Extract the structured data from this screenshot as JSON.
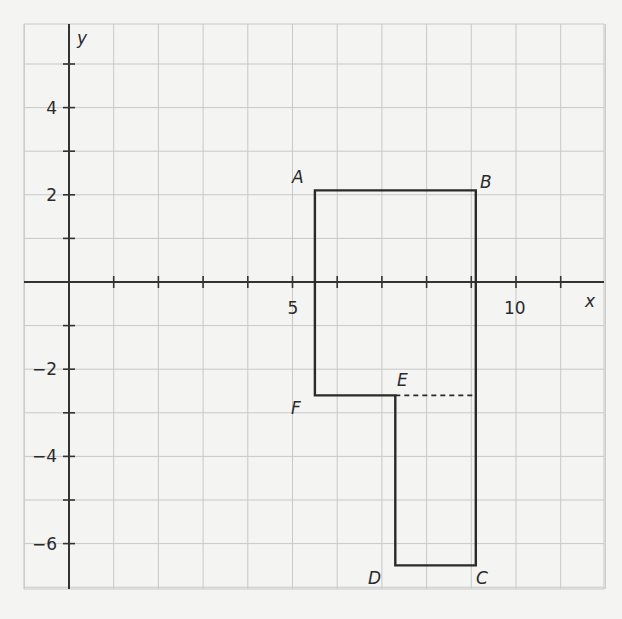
{
  "diagram": {
    "type": "coordinate-plane-polygon",
    "axes": {
      "x_label": "x",
      "y_label": "y",
      "x_range": [
        -1,
        12
      ],
      "y_range": [
        -7,
        6
      ],
      "x_tick_labels": [
        {
          "value": 5,
          "label": "5"
        },
        {
          "value": 10,
          "label": "10"
        }
      ],
      "y_tick_labels": [
        {
          "value": 4,
          "label": "4"
        },
        {
          "value": 2,
          "label": "2"
        },
        {
          "value": -2,
          "label": "−2"
        },
        {
          "value": -4,
          "label": "−4"
        },
        {
          "value": -6,
          "label": "−6"
        }
      ],
      "grid": true
    },
    "polygon": {
      "vertices": [
        {
          "name": "A",
          "x": 5.5,
          "y": 2.1
        },
        {
          "name": "B",
          "x": 9.1,
          "y": 2.1
        },
        {
          "name": "C",
          "x": 9.1,
          "y": -6.5
        },
        {
          "name": "D",
          "x": 7.3,
          "y": -6.5
        },
        {
          "name": "E",
          "x": 7.3,
          "y": -2.6
        },
        {
          "name": "F",
          "x": 5.5,
          "y": -2.6
        }
      ],
      "dashed_segment": {
        "from": "E",
        "to_x": 9.1,
        "y": -2.6
      }
    },
    "labels": {
      "A": "A",
      "B": "B",
      "C": "C",
      "D": "D",
      "E": "E",
      "F": "F"
    }
  }
}
